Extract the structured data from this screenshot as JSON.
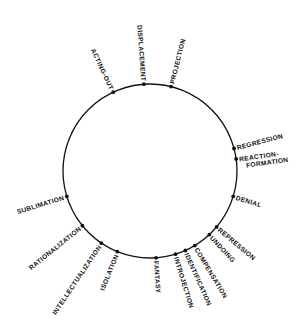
{
  "diagram": {
    "type": "radial-circle-diagram",
    "circle": {
      "cx": 150,
      "cy": 171,
      "r": 87,
      "stroke": "#111111"
    },
    "colors": {
      "ink": "#111111",
      "background": "#ffffff"
    },
    "nodes": [
      {
        "id": "acting-out",
        "label": "ACTING-OUT",
        "angle": -115
      },
      {
        "id": "displacement",
        "label": "DISPLACEMENT",
        "angle": -94
      },
      {
        "id": "projection",
        "label": "PROJECTION",
        "angle": -76
      },
      {
        "id": "regression",
        "label": "REGRESSION",
        "angle": -15
      },
      {
        "id": "reaction-formation",
        "label": "REACTION-",
        "label2": "FORMATION",
        "angle": -8
      },
      {
        "id": "denial",
        "label": "DENIAL",
        "angle": 17
      },
      {
        "id": "repression",
        "label": "REPRESSION",
        "angle": 40
      },
      {
        "id": "undoing",
        "label": "UNDOING",
        "angle": 47
      },
      {
        "id": "compensation",
        "label": "COMPENSATION",
        "angle": 59
      },
      {
        "id": "identification",
        "label": "IDENTIFICATION",
        "angle": 66
      },
      {
        "id": "introjection",
        "label": "INTROJECTION",
        "angle": 73
      },
      {
        "id": "fantasy",
        "label": "FANTASY",
        "angle": 86
      },
      {
        "id": "isolation",
        "label": "ISOLATION",
        "angle": 112
      },
      {
        "id": "intellectualization",
        "label": "INTELLECTUALIZATION",
        "angle": 124
      },
      {
        "id": "rationalization",
        "label": "RATIONALIZATION",
        "angle": 141
      },
      {
        "id": "sublimation",
        "label": "SUBLIMATION",
        "angle": 163
      }
    ]
  }
}
